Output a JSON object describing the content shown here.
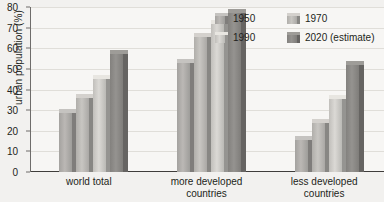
{
  "chart_data": {
    "type": "bar",
    "title": "",
    "xlabel": "",
    "ylabel": "urban population (%)",
    "ylim": [
      0,
      80
    ],
    "yticks": [
      0,
      10,
      20,
      30,
      40,
      50,
      60,
      70,
      80
    ],
    "grid": true,
    "legend_position": "top-right",
    "categories": [
      "world total",
      "more developed\ncountries",
      "less developed\ncountries"
    ],
    "series": [
      {
        "name": "1950",
        "values": [
          28.5,
          53,
          15.5
        ],
        "color": "#b0aeab"
      },
      {
        "name": "1970",
        "values": [
          36,
          65.5,
          24
        ],
        "color": "#bdbbb7"
      },
      {
        "name": "1990",
        "values": [
          45,
          72,
          35.5
        ],
        "color": "#cfcdc9"
      },
      {
        "name": "2020 (estimate)",
        "values": [
          57,
          77,
          52
        ],
        "color": "#8d8b88"
      }
    ]
  },
  "legend": {
    "rows": [
      [
        {
          "label": "1950",
          "color": "#b0aeab"
        },
        {
          "label": "1970",
          "color": "#bdbbb7"
        }
      ],
      [
        {
          "label": "1990",
          "color": "#cfcdc9"
        },
        {
          "label": "2020 (estimate)",
          "color": "#8d8b88"
        }
      ]
    ]
  },
  "axis": {
    "tick_labels": [
      "80",
      "70",
      "60",
      "50",
      "40",
      "30",
      "20",
      "10",
      "0"
    ],
    "y_title": "urban population (%)"
  },
  "colors": {
    "page_background": "#f2f1ef",
    "plot_background": "#f7f6f4",
    "gridline": "#e0ded9",
    "axis": "#3f3d3b",
    "text": "#231f20"
  }
}
